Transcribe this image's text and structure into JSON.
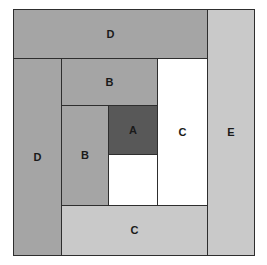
{
  "diagram": {
    "canvas": {
      "width": 267,
      "height": 265,
      "background": "#ffffff"
    },
    "outline": {
      "x": 13,
      "y": 9,
      "width": 242,
      "height": 247,
      "stroke": "#2e2e2e"
    },
    "palette": {
      "dark": "#585858",
      "medium": "#a5a5a5",
      "light": "#c9c9c9",
      "white": "#ffffff",
      "stroke": "#2e2e2e",
      "text": "#1a1a1a"
    },
    "blocks": [
      {
        "id": "d-top",
        "label": "D",
        "x": 13,
        "y": 9,
        "width": 195,
        "height": 50,
        "fill": "#a5a5a5"
      },
      {
        "id": "e-right",
        "label": "E",
        "x": 207,
        "y": 9,
        "width": 48,
        "height": 247,
        "fill": "#c9c9c9"
      },
      {
        "id": "d-left",
        "label": "D",
        "x": 13,
        "y": 58,
        "width": 49,
        "height": 198,
        "fill": "#a5a5a5"
      },
      {
        "id": "b-top",
        "label": "B",
        "x": 61,
        "y": 58,
        "width": 97,
        "height": 48,
        "fill": "#a5a5a5"
      },
      {
        "id": "c-right",
        "label": "C",
        "x": 157,
        "y": 58,
        "width": 51,
        "height": 148,
        "fill": "#ffffff"
      },
      {
        "id": "b-left",
        "label": "B",
        "x": 61,
        "y": 105,
        "width": 48,
        "height": 101,
        "fill": "#a5a5a5"
      },
      {
        "id": "a-center",
        "label": "A",
        "x": 108,
        "y": 105,
        "width": 50,
        "height": 50,
        "fill": "#585858"
      },
      {
        "id": "white-mid",
        "label": "",
        "x": 108,
        "y": 154,
        "width": 50,
        "height": 52,
        "fill": "#ffffff"
      },
      {
        "id": "c-bottom",
        "label": "C",
        "x": 61,
        "y": 205,
        "width": 147,
        "height": 51,
        "fill": "#c9c9c9"
      }
    ]
  }
}
